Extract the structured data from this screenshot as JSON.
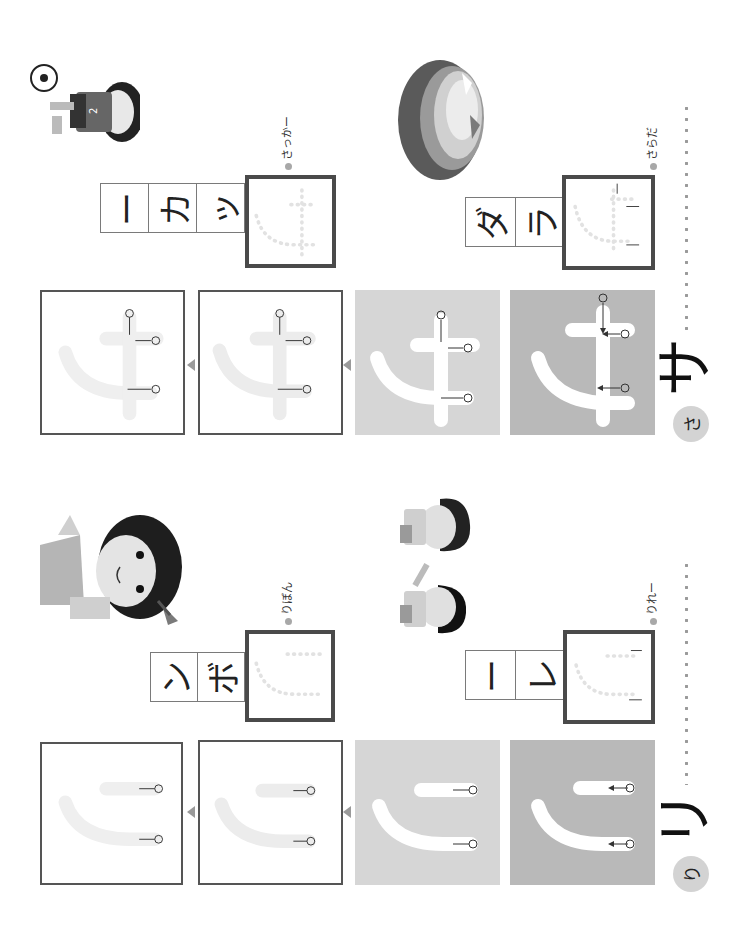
{
  "page": {
    "orientation": "rotated-90-ccw",
    "background": "#ffffff",
    "fill_dark": "#b9b9b9",
    "fill_light": "#d6d6d6",
    "border_color": "#555555"
  },
  "sections": [
    {
      "id": "sa",
      "character": "サ",
      "reading": "さ",
      "step_numbers": [
        "①",
        "②",
        "③"
      ],
      "words": [
        {
          "reading_label": "さらだ",
          "cells": [
            "ラ",
            "ダ"
          ],
          "trace_char": "サ",
          "picture": "salad"
        },
        {
          "reading_label": "さっかー",
          "cells": [
            "ッ",
            "カ",
            "ー"
          ],
          "trace_char": "サ",
          "picture": "soccer-player"
        }
      ]
    },
    {
      "id": "ri",
      "character": "リ",
      "reading": "り",
      "step_numbers": [
        "①",
        "②"
      ],
      "words": [
        {
          "reading_label": "りれー",
          "cells": [
            "レ",
            "ー"
          ],
          "trace_char": "リ",
          "picture": "relay-runners"
        },
        {
          "reading_label": "りぼん",
          "cells": [
            "ボ",
            "ン"
          ],
          "trace_char": "リ",
          "picture": "girl-with-ribbon"
        }
      ]
    }
  ],
  "decor": {
    "sa_ribbon_mark": "゛",
    "next_arrow": "next-step-arrow"
  }
}
